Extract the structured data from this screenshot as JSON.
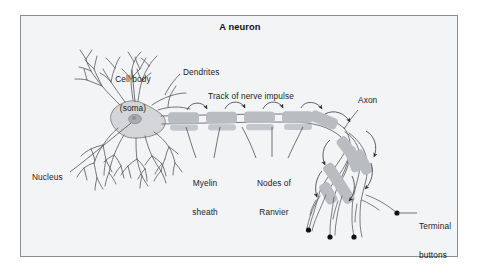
{
  "figure": {
    "title": "A neuron",
    "background_color": "#f3f4f6",
    "border_color": "#8b8d90",
    "ink_color": "#4a4a4a",
    "text_color": "#1b1b1b",
    "myelin_color": "#b9bcc0",
    "soma_color": "#d3d5d8",
    "nucleus_color": "#a9abae",
    "terminal_button_color": "#111111"
  },
  "labels": {
    "cell_body_line1": "Cell body",
    "cell_body_line2": "(soma)",
    "dendrites": "Dendrites",
    "track": "Track of nerve impulse",
    "axon": "Axon",
    "nucleus": "Nucleus",
    "myelin_line1": "Myelin",
    "myelin_line2": "sheath",
    "nodes_line1": "Nodes of",
    "nodes_line2": "Ranvier",
    "terminal_line1": "Terminal",
    "terminal_line2": "buttons"
  },
  "parts": [
    {
      "name": "cell-body-soma",
      "label": "Cell body (soma)"
    },
    {
      "name": "dendrites",
      "label": "Dendrites"
    },
    {
      "name": "nucleus",
      "label": "Nucleus"
    },
    {
      "name": "axon",
      "label": "Axon"
    },
    {
      "name": "myelin-sheath",
      "label": "Myelin sheath"
    },
    {
      "name": "nodes-of-ranvier",
      "label": "Nodes of Ranvier"
    },
    {
      "name": "terminal-buttons",
      "label": "Terminal buttons"
    },
    {
      "name": "track-of-nerve-impulse",
      "label": "Track of nerve impulse"
    }
  ],
  "counts": {
    "myelin_segments_main_axon": 6,
    "nodes_of_ranvier": 5,
    "impulse_arcs": 10,
    "terminal_buttons": 4
  }
}
